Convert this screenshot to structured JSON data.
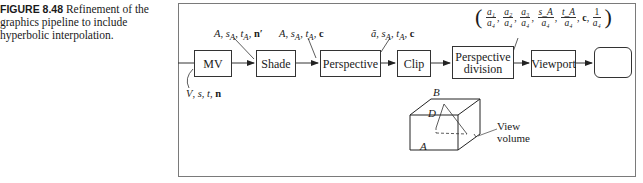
{
  "caption": {
    "figure_label": "FIGURE 8.48",
    "text": "Refinement of the graphics pipeline to include hyperbolic interpolation."
  },
  "pipeline": {
    "stages": [
      {
        "id": "mv",
        "label": "MV"
      },
      {
        "id": "shade",
        "label": "Shade"
      },
      {
        "id": "perspective",
        "label": "Perspective"
      },
      {
        "id": "clip",
        "label": "Clip"
      },
      {
        "id": "perspective_division",
        "label_line1": "Perspective",
        "label_line2": "division"
      },
      {
        "id": "viewport",
        "label": "Viewport"
      },
      {
        "id": "display",
        "label": ""
      }
    ],
    "annotations": {
      "input": {
        "V": "V",
        "s": "s",
        "t": "t",
        "n": "n"
      },
      "after_mv": {
        "A": "A",
        "sA": "s",
        "sA_sub": "A",
        "tA": "t",
        "tA_sub": "A",
        "n": "n′"
      },
      "after_shade": {
        "A": "A",
        "sA": "s",
        "sA_sub": "A",
        "tA": "t",
        "tA_sub": "A",
        "c": "c"
      },
      "after_perspective": {
        "a": "ã",
        "sA": "s",
        "sA_sub": "A",
        "tA": "t",
        "tA_sub": "A",
        "c": "c"
      },
      "after_division": {
        "open": "(",
        "close": ")",
        "fractions": [
          {
            "num": "a₁",
            "den": "a₄"
          },
          {
            "num": "a₂",
            "den": "a₄"
          },
          {
            "num": "a₃",
            "den": "a₄"
          },
          {
            "num": "s_A",
            "den": "a₄"
          },
          {
            "num": "t_A",
            "den": "a₄"
          }
        ],
        "c": "c",
        "last_fraction": {
          "num": "1",
          "den": "a₄"
        }
      }
    }
  },
  "view_volume": {
    "points": {
      "A": "A",
      "B": "B",
      "D": "D"
    },
    "label_line1": "View",
    "label_line2": "volume"
  }
}
